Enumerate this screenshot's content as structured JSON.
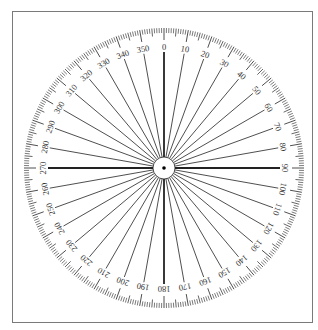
{
  "diagram": {
    "type": "protractor-compass-rose",
    "center": {
      "x": 164,
      "y": 168
    },
    "outer_radius": 140,
    "inner_circle_radius": 11,
    "degree_range": [
      0,
      360
    ],
    "tick_every_degrees": 1,
    "medium_tick_every_degrees": 5,
    "major_tick_every_degrees": 10,
    "radial_line_every_degrees": 10,
    "bold_axes": [
      0,
      90,
      180,
      270
    ],
    "labels": [
      "0",
      "10",
      "20",
      "30",
      "40",
      "50",
      "60",
      "70",
      "80",
      "90",
      "100",
      "110",
      "120",
      "130",
      "140",
      "150",
      "160",
      "170",
      "180",
      "190",
      "200",
      "210",
      "220",
      "230",
      "240",
      "250",
      "260",
      "270",
      "280",
      "290",
      "300",
      "310",
      "320",
      "330",
      "340",
      "350"
    ],
    "colors": {
      "line": "#222222",
      "frame": "#7a7a7a",
      "label": "#333333"
    }
  }
}
